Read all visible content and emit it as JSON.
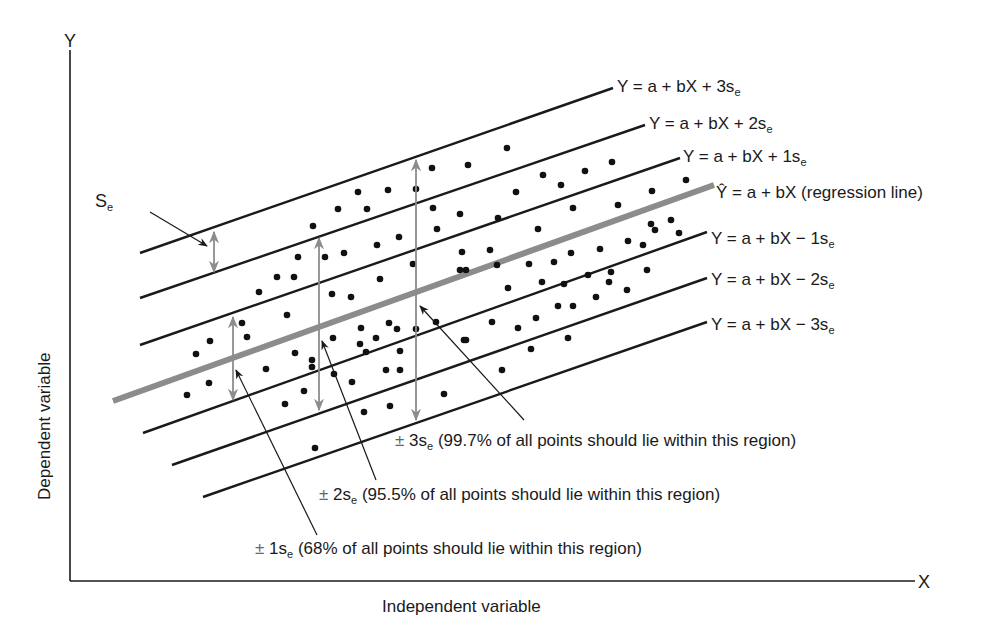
{
  "axes": {
    "y_name": "Y",
    "x_name": "X",
    "y_label": "Dependent variable",
    "x_label": "Independent variable"
  },
  "lines": [
    {
      "id": "plus3",
      "lhs": "Y",
      "rhs": "= a + bX + 3s",
      "sub": "e",
      "x1": 140,
      "y1": 253,
      "x2": 613,
      "y2": 88,
      "label_x": 617,
      "label_y": 78
    },
    {
      "id": "plus2",
      "lhs": "Y",
      "rhs": "= a + bX + 2s",
      "sub": "e",
      "x1": 140,
      "y1": 298,
      "x2": 645,
      "y2": 125,
      "label_x": 649,
      "label_y": 115
    },
    {
      "id": "plus1",
      "lhs": "Y",
      "rhs": "= a + bX + 1s",
      "sub": "e",
      "x1": 140,
      "y1": 345,
      "x2": 680,
      "y2": 158,
      "label_x": 683,
      "label_y": 148
    },
    {
      "id": "regression",
      "lhs": "Ŷ",
      "rhs": "= a + bX (regression line)",
      "sub": "",
      "x1": 113,
      "y1": 401,
      "x2": 714,
      "y2": 185,
      "label_x": 716,
      "label_y": 184
    },
    {
      "id": "minus1",
      "lhs": "Y",
      "rhs": "= a + bX − 1s",
      "sub": "e",
      "x1": 143,
      "y1": 433,
      "x2": 707,
      "y2": 232,
      "label_x": 711,
      "label_y": 230
    },
    {
      "id": "minus2",
      "lhs": "Y",
      "rhs": "= a + bX − 2s",
      "sub": "e",
      "x1": 172,
      "y1": 465,
      "x2": 707,
      "y2": 278,
      "label_x": 711,
      "label_y": 271
    },
    {
      "id": "minus3",
      "lhs": "Y",
      "rhs": "= a + bX − 3s",
      "sub": "e",
      "x1": 203,
      "y1": 497,
      "x2": 707,
      "y2": 322,
      "label_x": 711,
      "label_y": 316
    }
  ],
  "se_marker": {
    "text": "S",
    "sub": "e"
  },
  "regions": [
    {
      "id": "one_se",
      "pm": "±",
      "k": "1s",
      "sub": "e",
      "text": "(68% of all points should lie within this region)"
    },
    {
      "id": "two_se",
      "pm": "±",
      "k": "2s",
      "sub": "e",
      "text": "(95.5% of all points should lie within this region)"
    },
    {
      "id": "three_se",
      "pm": "±",
      "k": "3s",
      "sub": "e",
      "text": "(99.7% of all points should lie within this region)"
    }
  ],
  "colors": {
    "line": "#1a1a1a",
    "regression": "#8c8c8c",
    "band_arrow": "#8c8c8c",
    "point": "#111111"
  },
  "points": [
    [
      313,
      226
    ],
    [
      338,
      209
    ],
    [
      358,
      192
    ],
    [
      367,
      209
    ],
    [
      388,
      190
    ],
    [
      416,
      189
    ],
    [
      432,
      168
    ],
    [
      433,
      208
    ],
    [
      468,
      165
    ],
    [
      507,
      148
    ],
    [
      516,
      192
    ],
    [
      543,
      175
    ],
    [
      561,
      185
    ],
    [
      585,
      171
    ],
    [
      612,
      162
    ],
    [
      652,
      191
    ],
    [
      686,
      180
    ],
    [
      325,
      257
    ],
    [
      344,
      253
    ],
    [
      377,
      245
    ],
    [
      399,
      237
    ],
    [
      460,
      214
    ],
    [
      462,
      252
    ],
    [
      498,
      218
    ],
    [
      538,
      229
    ],
    [
      573,
      208
    ],
    [
      618,
      205
    ],
    [
      651,
      224
    ],
    [
      259,
      292
    ],
    [
      277,
      277
    ],
    [
      294,
      277
    ],
    [
      298,
      257
    ],
    [
      332,
      294
    ],
    [
      351,
      297
    ],
    [
      380,
      279
    ],
    [
      413,
      264
    ],
    [
      437,
      229
    ],
    [
      490,
      250
    ],
    [
      287,
      315
    ],
    [
      295,
      353
    ],
    [
      333,
      338
    ],
    [
      361,
      328
    ],
    [
      376,
      338
    ],
    [
      389,
      323
    ],
    [
      460,
      270
    ],
    [
      497,
      265
    ],
    [
      529,
      264
    ],
    [
      554,
      262
    ],
    [
      571,
      253
    ],
    [
      600,
      249
    ],
    [
      628,
      241
    ],
    [
      643,
      245
    ],
    [
      655,
      230
    ],
    [
      671,
      220
    ],
    [
      679,
      233
    ],
    [
      196,
      354
    ],
    [
      210,
      341
    ],
    [
      242,
      323
    ],
    [
      247,
      337
    ],
    [
      266,
      369
    ],
    [
      312,
      367
    ],
    [
      334,
      374
    ],
    [
      352,
      382
    ],
    [
      366,
      352
    ],
    [
      386,
      370
    ],
    [
      397,
      329
    ],
    [
      416,
      329
    ],
    [
      436,
      322
    ],
    [
      466,
      270
    ],
    [
      466,
      340
    ],
    [
      508,
      288
    ],
    [
      542,
      282
    ],
    [
      564,
      284
    ],
    [
      588,
      275
    ],
    [
      611,
      272
    ],
    [
      647,
      270
    ],
    [
      187,
      395
    ],
    [
      209,
      383
    ],
    [
      285,
      404
    ],
    [
      304,
      391
    ],
    [
      312,
      360
    ],
    [
      360,
      344
    ],
    [
      364,
      412
    ],
    [
      390,
      406
    ],
    [
      444,
      394
    ],
    [
      464,
      340
    ],
    [
      492,
      322
    ],
    [
      518,
      328
    ],
    [
      536,
      318
    ],
    [
      558,
      306
    ],
    [
      573,
      306
    ],
    [
      596,
      297
    ],
    [
      609,
      282
    ],
    [
      627,
      290
    ],
    [
      315,
      448
    ],
    [
      400,
      351
    ],
    [
      400,
      370
    ],
    [
      502,
      370
    ],
    [
      531,
      349
    ],
    [
      568,
      338
    ]
  ],
  "band_arrows": [
    {
      "id": "se_width",
      "x": 214,
      "y1": 232,
      "y2": 272
    },
    {
      "id": "pm1",
      "x": 233,
      "y1": 317,
      "y2": 400
    },
    {
      "id": "pm2",
      "x": 319,
      "y1": 238,
      "y2": 410
    },
    {
      "id": "pm3",
      "x": 416,
      "y1": 160,
      "y2": 420
    }
  ],
  "callouts": [
    {
      "id": "se_pointer",
      "x1": 150,
      "y1": 212,
      "x2": 207,
      "y2": 246
    },
    {
      "id": "pm1_pointer",
      "x1": 317,
      "y1": 535,
      "x2": 236,
      "y2": 370
    },
    {
      "id": "pm2_pointer",
      "x1": 376,
      "y1": 480,
      "x2": 322,
      "y2": 341
    },
    {
      "id": "pm3_pointer",
      "x1": 524,
      "y1": 420,
      "x2": 420,
      "y2": 306
    }
  ]
}
